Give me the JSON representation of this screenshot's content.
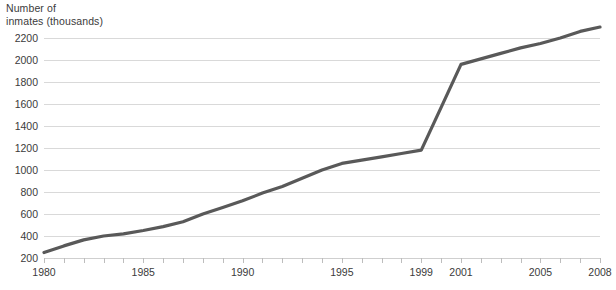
{
  "chart_data": {
    "type": "line",
    "title": "",
    "subtitle": "",
    "xlabel": "",
    "ylabel": "Number of\ninmates (thousands)",
    "ylabel_lines": [
      "Number of",
      "inmates (thousands)"
    ],
    "grid": "horizontal",
    "legend": "none",
    "line_color": "#595959",
    "grid_color": "#d9d9d9",
    "xlim": [
      1980,
      2008
    ],
    "ylim": [
      200,
      2200
    ],
    "ytick_labels": [
      "2200",
      "2000",
      "1800",
      "1600",
      "1400",
      "1200",
      "1000",
      "800",
      "600",
      "400",
      "200"
    ],
    "ytick_values": [
      2200,
      2000,
      1800,
      1600,
      1400,
      1200,
      1000,
      800,
      600,
      400,
      200
    ],
    "xtick_years": [
      1980,
      1981,
      1982,
      1983,
      1984,
      1985,
      1986,
      1987,
      1988,
      1989,
      1990,
      1991,
      1992,
      1993,
      1994,
      1995,
      1996,
      1997,
      1998,
      1999,
      2000,
      2001,
      2002,
      2003,
      2004,
      2005,
      2006,
      2007,
      2008
    ],
    "xtick_labels": [
      "1980",
      "1985",
      "1990",
      "1995",
      "1999",
      "2001",
      "2005",
      "2008"
    ],
    "xtick_label_years": [
      1980,
      1985,
      1990,
      1995,
      1999,
      2001,
      2005,
      2008
    ],
    "x": [
      1980,
      1981,
      1982,
      1983,
      1984,
      1985,
      1986,
      1987,
      1988,
      1989,
      1990,
      1991,
      1992,
      1993,
      1994,
      1995,
      1996,
      1997,
      1998,
      1999,
      2000,
      2001,
      2002,
      2003,
      2004,
      2005,
      2006,
      2007,
      2008
    ],
    "values": [
      250,
      310,
      365,
      400,
      420,
      450,
      485,
      530,
      600,
      660,
      720,
      790,
      850,
      925,
      1000,
      1060,
      1090,
      1120,
      1150,
      1180,
      1570,
      1960,
      2010,
      2060,
      2110,
      2150,
      2200,
      2260,
      2300
    ],
    "series": [
      {
        "name": "Number of inmates",
        "values": [
          250,
          310,
          365,
          400,
          420,
          450,
          485,
          530,
          600,
          660,
          720,
          790,
          850,
          925,
          1000,
          1060,
          1090,
          1120,
          1150,
          1180,
          1570,
          1960,
          2010,
          2060,
          2110,
          2150,
          2200,
          2260,
          2300
        ]
      }
    ]
  }
}
